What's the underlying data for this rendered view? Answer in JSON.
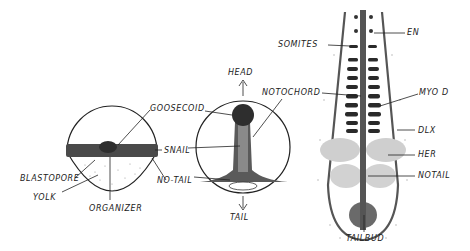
{
  "diagram": {
    "panels": [
      {
        "id": "early-gastrula",
        "labels": {
          "goosecoid": "GOOSECOID",
          "snail": "SNAIL",
          "no_tail": "NO-TAIL",
          "blastopore": "BLASTOPORE",
          "yolk": "YOLK",
          "organizer": "ORGANIZER"
        }
      },
      {
        "id": "late-gastrula",
        "labels": {
          "head": "HEAD",
          "tail": "TAIL",
          "notochord": "NOTOCHORD"
        }
      },
      {
        "id": "segmentation-embryo",
        "labels": {
          "somites": "SOMITES",
          "en": "EN",
          "myod": "MYO D",
          "dlx": "DLX",
          "her": "HER",
          "notail": "NOTAIL",
          "tailbud": "TAILBUD"
        }
      }
    ],
    "colors": {
      "ink": "#222222",
      "dark_stain": "#3a3a3a",
      "mid_stain": "#7a7a7a",
      "light_stain": "#c8c8c8"
    }
  }
}
